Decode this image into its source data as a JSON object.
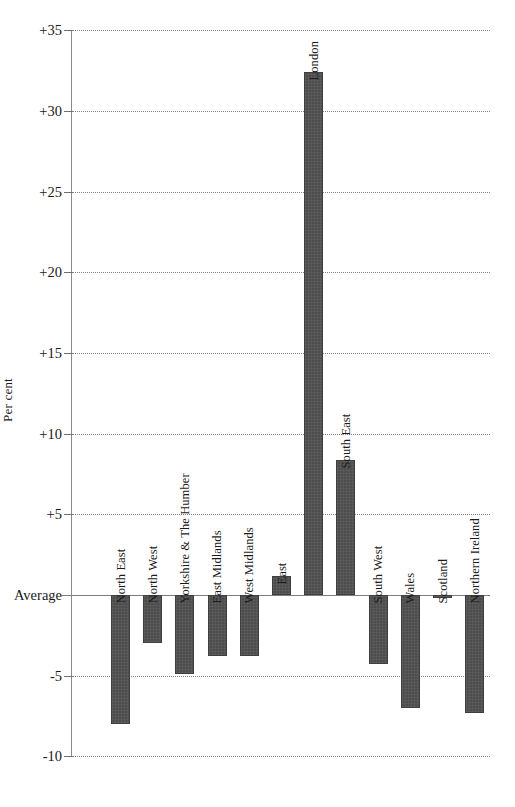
{
  "chart_data": {
    "type": "bar",
    "title": "",
    "xlabel": "",
    "ylabel": "Per cent",
    "ylim": [
      -10,
      35
    ],
    "yticks": [
      -10,
      -5,
      0,
      5,
      10,
      15,
      20,
      25,
      30,
      35
    ],
    "ytick_labels": [
      "-10",
      "-5",
      "Average",
      "+5",
      "+10",
      "+15",
      "+20",
      "+25",
      "+30",
      "+35"
    ],
    "grid": true,
    "legend": "none",
    "baseline_label": "Average",
    "bar_color": "#4d4d4d",
    "categories": [
      "North East",
      "North West",
      "Yorkshire & The Humber",
      "East Midlands",
      "West Midlands",
      "East",
      "London",
      "South East",
      "South West",
      "Wales",
      "Scotland",
      "Northern Ireland"
    ],
    "values": [
      -8.0,
      -3.0,
      -4.9,
      -3.8,
      -3.8,
      1.2,
      32.4,
      8.35,
      -4.3,
      -7.0,
      -0.2,
      -7.3
    ]
  },
  "axis": {
    "y_title": "Per cent"
  }
}
